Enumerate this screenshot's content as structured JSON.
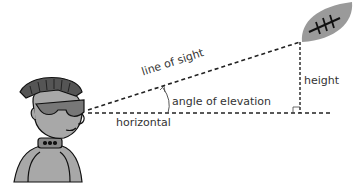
{
  "diagram": {
    "title": "Angle of elevation",
    "labels": {
      "line_of_sight": "line of sight",
      "angle": "angle of elevation",
      "horizontal": "horizontal",
      "height": "height"
    },
    "figures": [
      "punk-character",
      "football"
    ],
    "colors": {
      "line": "#222222",
      "fill_grey": "#9a9a9a",
      "dark_grey": "#555555",
      "label": "#333333"
    }
  }
}
